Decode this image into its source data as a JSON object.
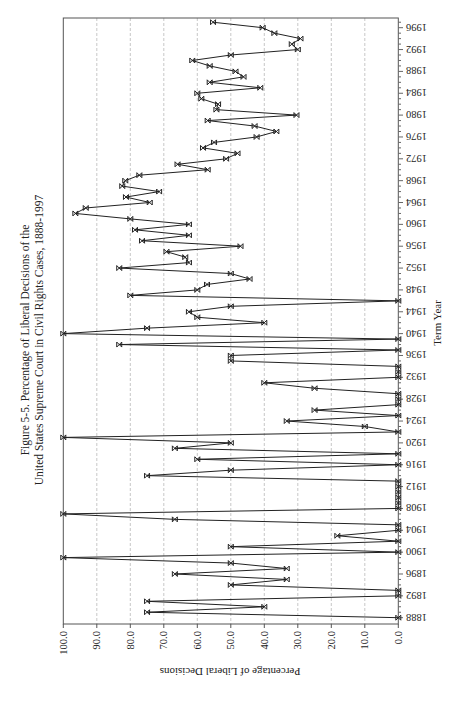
{
  "figure": {
    "title_line1": "Figure 5-5.  Percentage of Liberal Decisions of the",
    "title_line2": "United States Supreme Court in Civil Rights Cases, 1888-1997",
    "x_axis_label": "Term Year",
    "y_axis_label": "Percentage of Liberal Decisions",
    "x_tick_labels": [
      "1888",
      "1892",
      "1896",
      "1900",
      "1904",
      "1908",
      "1912",
      "1916",
      "1920",
      "1924",
      "1928",
      "1932",
      "1936",
      "1940",
      "1944",
      "1948",
      "1952",
      "1956",
      "1960",
      "1964",
      "1968",
      "1972",
      "1976",
      "1980",
      "1984",
      "1988",
      "1992",
      "1996"
    ],
    "y_tick_labels": [
      "0.0",
      "10.0",
      "20.0",
      "30.0",
      "40.0",
      "50.0",
      "60.0",
      "70.0",
      "80.0",
      "90.0",
      "100.0"
    ]
  },
  "chart_data": {
    "type": "line",
    "title": "Figure 5-5. Percentage of Liberal Decisions of the United States Supreme Court in Civil Rights Cases, 1888-1997",
    "xlabel": "Term Year",
    "ylabel": "Percentage of Liberal Decisions",
    "ylim": [
      0,
      100
    ],
    "xlim": [
      1888,
      1997
    ],
    "grid": true,
    "orientation": "rotated 90 degrees (years run bottom-to-top on right, percentage runs right-to-left along bottom)",
    "marker": "x",
    "x": [
      1888,
      1889,
      1890,
      1891,
      1892,
      1893,
      1894,
      1895,
      1896,
      1897,
      1898,
      1899,
      1900,
      1901,
      1902,
      1903,
      1904,
      1905,
      1906,
      1907,
      1908,
      1909,
      1910,
      1911,
      1912,
      1913,
      1914,
      1915,
      1916,
      1917,
      1918,
      1919,
      1920,
      1921,
      1922,
      1923,
      1924,
      1925,
      1926,
      1927,
      1928,
      1929,
      1930,
      1931,
      1932,
      1933,
      1934,
      1935,
      1936,
      1937,
      1938,
      1939,
      1940,
      1941,
      1942,
      1943,
      1944,
      1945,
      1946,
      1947,
      1948,
      1949,
      1950,
      1951,
      1952,
      1953,
      1954,
      1955,
      1956,
      1957,
      1958,
      1959,
      1960,
      1961,
      1962,
      1963,
      1964,
      1965,
      1966,
      1967,
      1968,
      1969,
      1970,
      1971,
      1972,
      1973,
      1974,
      1975,
      1976,
      1977,
      1978,
      1979,
      1980,
      1981,
      1982,
      1983,
      1984,
      1985,
      1986,
      1987,
      1988,
      1989,
      1990,
      1991,
      1992,
      1993,
      1994,
      1995,
      1996,
      1997
    ],
    "values": [
      0,
      75,
      40,
      75,
      0,
      0,
      50,
      33.3,
      66.7,
      33.3,
      50,
      100,
      0,
      50,
      0,
      18.2,
      0,
      0,
      66.7,
      100,
      0,
      0,
      0,
      0,
      0,
      0,
      75,
      50,
      0,
      60,
      0,
      66.7,
      50,
      100,
      0,
      10,
      33.3,
      0,
      25,
      0,
      0,
      0,
      25,
      40,
      0,
      0,
      0,
      50,
      50,
      0,
      83.3,
      0,
      100,
      75,
      40,
      60,
      62.5,
      50,
      0,
      80,
      60,
      57.1,
      44.4,
      50,
      83.3,
      62.5,
      63.6,
      69.2,
      47.1,
      76.5,
      62.5,
      78.6,
      62.5,
      80,
      96.4,
      93.3,
      74.2,
      81.3,
      71.4,
      82.4,
      81.5,
      77.3,
      56.9,
      65.9,
      51.4,
      48,
      58.3,
      55,
      42.3,
      36.4,
      42.9,
      56.9,
      30.4,
      54.3,
      53.8,
      58.8,
      60,
      41.2,
      56.3,
      46.2,
      48.6,
      56.3,
      61.5,
      50,
      30,
      31.8,
      29.2,
      37,
      40.5,
      55.3
    ]
  }
}
